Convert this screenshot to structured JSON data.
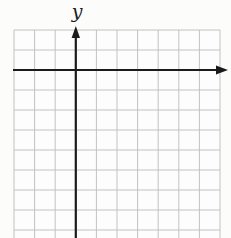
{
  "page": {
    "background": "#fcfcfb"
  },
  "figure": {
    "y_axis_label": "y",
    "x_axis_label": "",
    "grid": {
      "left": 14,
      "top": 30,
      "columns": 10,
      "col_width": 20.6,
      "row_height": 20,
      "h_lines": 11,
      "bottom_clip": 238,
      "line_color": "#c2c2c2",
      "fill": "#fdfdfd"
    },
    "axes": {
      "color": "#1b1b1b",
      "line_width": 2.2,
      "x_axis": {
        "y": 70,
        "x_start": 13,
        "x_end": 217,
        "arrow_tip_x": 228,
        "arrow_half_width": 4.6
      },
      "y_axis": {
        "x": 75.8,
        "y_start": 238,
        "y_end": 38,
        "arrow_tip_y": 26,
        "arrow_half_width": 4.2
      }
    }
  }
}
